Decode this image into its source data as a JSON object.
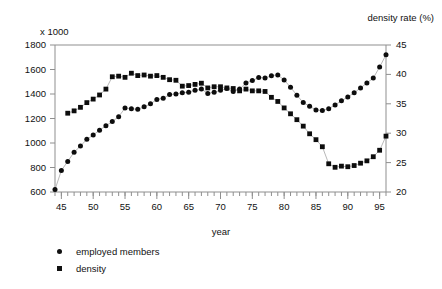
{
  "chart_data": {
    "type": "scatter",
    "title": "",
    "xlabel": "year",
    "ylabel_left": "x 1000",
    "ylabel_right": "density rate (%)",
    "xlim": [
      44,
      96
    ],
    "xticks": [
      45,
      50,
      55,
      60,
      65,
      70,
      75,
      80,
      85,
      90,
      95
    ],
    "xtick_labels": [
      "45",
      "50",
      "55",
      "60",
      "65",
      "70",
      "75",
      "80",
      "85",
      "90",
      "95"
    ],
    "xminor_step": 1,
    "ylim_left": [
      600,
      1800
    ],
    "yticks_left": [
      600,
      800,
      1000,
      1200,
      1400,
      1600,
      1800
    ],
    "ytick_labels_left": [
      "600",
      "800",
      "1000",
      "1200",
      "1400",
      "1600",
      "1800"
    ],
    "ylim_right": [
      20,
      45
    ],
    "yticks_right": [
      20,
      25,
      30,
      35,
      40,
      45
    ],
    "ytick_labels_right": [
      "20",
      "25",
      "30",
      "35",
      "40",
      "45"
    ],
    "grid": false,
    "legend_position": "below-left",
    "series": [
      {
        "name": "employed members",
        "marker": "circle",
        "axis": "left",
        "unit": "x 1000",
        "x": [
          44,
          45,
          46,
          47,
          48,
          49,
          50,
          51,
          52,
          53,
          54,
          55,
          56,
          57,
          58,
          59,
          60,
          61,
          62,
          63,
          64,
          65,
          66,
          67,
          68,
          69,
          70,
          71,
          72,
          73,
          74,
          75,
          76,
          77,
          78,
          79,
          80,
          81,
          82,
          83,
          84,
          85,
          86,
          87,
          88,
          89,
          90,
          91,
          92,
          93,
          94,
          95,
          96
        ],
        "values": [
          620,
          775,
          850,
          925,
          975,
          1030,
          1065,
          1105,
          1140,
          1175,
          1215,
          1285,
          1280,
          1275,
          1295,
          1320,
          1355,
          1365,
          1395,
          1400,
          1410,
          1415,
          1430,
          1440,
          1405,
          1415,
          1430,
          1445,
          1420,
          1440,
          1490,
          1510,
          1535,
          1530,
          1550,
          1555,
          1515,
          1455,
          1390,
          1330,
          1300,
          1270,
          1265,
          1280,
          1310,
          1345,
          1375,
          1410,
          1450,
          1490,
          1530,
          1620,
          1720
        ]
      },
      {
        "name": "density",
        "marker": "square",
        "axis": "right",
        "unit": "%",
        "x": [
          46,
          47,
          48,
          49,
          50,
          51,
          52,
          53,
          54,
          55,
          56,
          57,
          58,
          59,
          60,
          61,
          62,
          63,
          64,
          65,
          66,
          67,
          68,
          69,
          70,
          71,
          72,
          73,
          74,
          75,
          76,
          77,
          78,
          79,
          80,
          81,
          82,
          83,
          84,
          85,
          86,
          87,
          88,
          89,
          90,
          91,
          92,
          93,
          94,
          95,
          96
        ],
        "values": [
          33.4,
          33.8,
          34.4,
          35.2,
          35.8,
          36.5,
          37.5,
          39.6,
          39.7,
          39.5,
          40.2,
          39.8,
          39.9,
          39.7,
          39.8,
          39.5,
          39.1,
          39.0,
          38.0,
          38.1,
          38.3,
          38.5,
          37.7,
          37.9,
          37.9,
          37.7,
          37.6,
          37.2,
          37.5,
          37.2,
          37.2,
          37.1,
          36.1,
          35.4,
          34.3,
          33.3,
          32.3,
          31.2,
          29.9,
          28.9,
          27.7,
          24.8,
          24.2,
          24.4,
          24.3,
          24.5,
          24.9,
          25.3,
          26.0,
          27.1,
          29.5
        ]
      }
    ]
  }
}
